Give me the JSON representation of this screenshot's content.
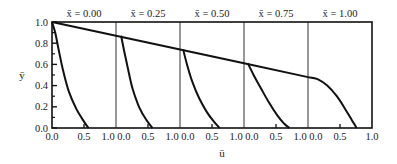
{
  "chart_data": {
    "type": "line",
    "title": "",
    "xlabel": "ū",
    "ylabel": "ȳ",
    "ylim": [
      0.0,
      1.0
    ],
    "xlim_per_panel": [
      0.0,
      1.0
    ],
    "grid": false,
    "legend": null,
    "y_ticks": [
      "0.0",
      "0.2",
      "0.4",
      "0.6",
      "0.8",
      "1.0"
    ],
    "x_ticks_per_panel": [
      "0.0",
      "0.5",
      "1.0"
    ],
    "panels": [
      {
        "label": "x̄ = 0.00",
        "curve": [
          [
            0.0,
            1.0
          ],
          [
            0.05,
            0.9
          ],
          [
            0.1,
            0.75
          ],
          [
            0.17,
            0.55
          ],
          [
            0.26,
            0.35
          ],
          [
            0.38,
            0.18
          ],
          [
            0.5,
            0.06
          ],
          [
            0.57,
            0.0
          ]
        ]
      },
      {
        "label": "x̄ = 0.25",
        "curve": [
          [
            0.08,
            0.87
          ],
          [
            0.13,
            0.72
          ],
          [
            0.19,
            0.55
          ],
          [
            0.26,
            0.37
          ],
          [
            0.36,
            0.2
          ],
          [
            0.47,
            0.08
          ],
          [
            0.57,
            0.0
          ]
        ]
      },
      {
        "label": "x̄ = 0.50",
        "curve": [
          [
            0.05,
            0.74
          ],
          [
            0.11,
            0.6
          ],
          [
            0.19,
            0.44
          ],
          [
            0.3,
            0.28
          ],
          [
            0.42,
            0.15
          ],
          [
            0.53,
            0.06
          ],
          [
            0.62,
            0.0
          ]
        ]
      },
      {
        "label": "x̄ = 0.75",
        "curve": [
          [
            0.06,
            0.61
          ],
          [
            0.15,
            0.5
          ],
          [
            0.26,
            0.38
          ],
          [
            0.39,
            0.24
          ],
          [
            0.52,
            0.12
          ],
          [
            0.63,
            0.04
          ],
          [
            0.71,
            0.0
          ]
        ]
      },
      {
        "label": "x̄ = 1.00",
        "curve": [
          [
            0.0,
            0.48
          ],
          [
            0.15,
            0.46
          ],
          [
            0.3,
            0.4
          ],
          [
            0.45,
            0.3
          ],
          [
            0.58,
            0.18
          ],
          [
            0.68,
            0.08
          ],
          [
            0.76,
            0.0
          ]
        ]
      }
    ],
    "envelope": {
      "description": "Straight line connecting curve tops across panels",
      "points": [
        [
          0.0,
          1.0
        ],
        [
          0.25,
          0.87
        ],
        [
          0.5,
          0.74
        ],
        [
          0.75,
          0.61
        ],
        [
          1.0,
          0.48
        ]
      ]
    }
  },
  "labels": {
    "panel_titles": [
      "x̄ = 0.00",
      "x̄ = 0.25",
      "x̄ = 0.50",
      "x̄ = 0.75",
      "x̄ = 1.00"
    ],
    "y_axis": "ȳ",
    "x_axis": "ū",
    "x_tick_row": [
      "0.0",
      "0.5",
      "1.0 0.0",
      "0.5",
      "1.0 0.0",
      "0.5",
      "1.0 0.0",
      "0.5",
      "1.0 0.0",
      "0.5",
      "1.0"
    ]
  }
}
